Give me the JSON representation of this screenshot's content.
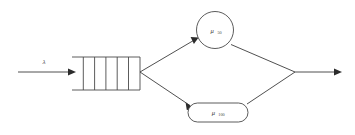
{
  "diagram": {
    "background_color": "#ffffff",
    "stroke_color": "#4a4a4a",
    "text_color": "#3a3a3a"
  },
  "arrival": {
    "rate_symbol": "λ",
    "label_name": "arrival-rate-lambda"
  },
  "queue": {
    "name": "queue-buffer",
    "slot_count": 6,
    "divider_count": 5
  },
  "servers": [
    {
      "id": "server-fast",
      "shape": "circle",
      "symbol": "μ",
      "subscript": "50",
      "full_label": "μ₅₀"
    },
    {
      "id": "server-slow",
      "shape": "rounded-rectangle",
      "symbol": "μ",
      "subscript": "100",
      "full_label": "μ₁₀₀"
    }
  ],
  "flows": [
    {
      "name": "arrival-arrow",
      "from": "source",
      "to": "queue-buffer"
    },
    {
      "name": "branch-upper-arrow",
      "from": "queue-buffer",
      "to": "server-fast"
    },
    {
      "name": "branch-lower-arrow",
      "from": "queue-buffer",
      "to": "server-slow"
    },
    {
      "name": "merge-upper-line",
      "from": "server-fast",
      "to": "merge-point"
    },
    {
      "name": "merge-lower-line",
      "from": "server-slow",
      "to": "merge-point"
    },
    {
      "name": "departure-arrow",
      "from": "merge-point",
      "to": "sink"
    }
  ]
}
